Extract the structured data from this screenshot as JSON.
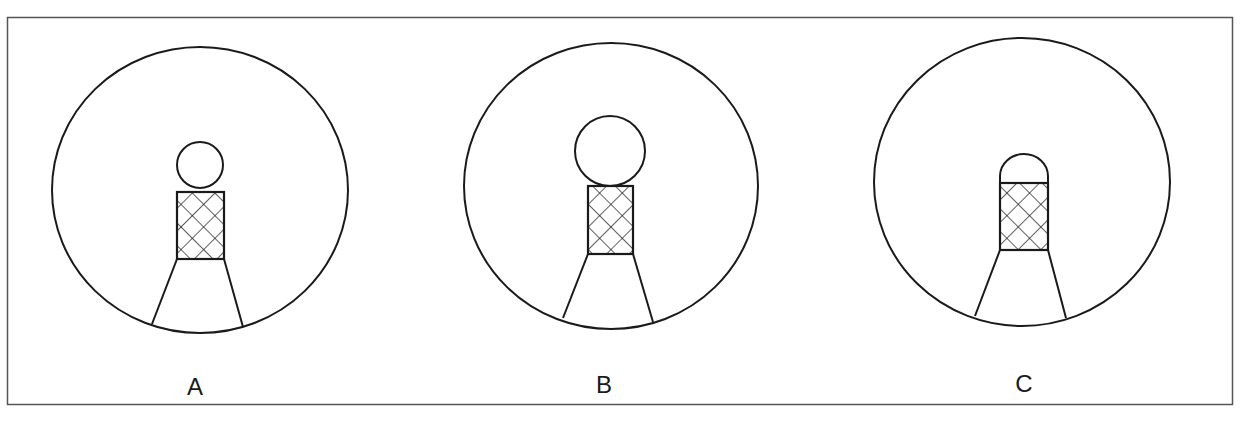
{
  "figure": {
    "border_color": "#555555",
    "line_color": "#1a1a1a",
    "panels": [
      {
        "label": "A",
        "head_shape": "circle",
        "head_size": "small"
      },
      {
        "label": "B",
        "head_shape": "circle",
        "head_size": "large"
      },
      {
        "label": "C",
        "head_shape": "half-dome",
        "head_size": "small"
      }
    ]
  }
}
